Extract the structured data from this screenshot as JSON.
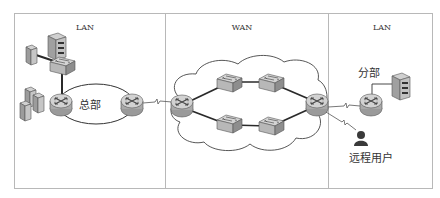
{
  "diagram": {
    "type": "network-topology",
    "colors": {
      "frame": "#b8b8b8",
      "link": "#3a3a3a",
      "cloud_stroke": "#444444",
      "device_fill": "#c9c9c9",
      "device_dark": "#7a7a7a",
      "user": "#333333"
    },
    "panels": [
      {
        "id": "lan-left",
        "label": "LAN"
      },
      {
        "id": "wan",
        "label": "WAN"
      },
      {
        "id": "lan-right",
        "label": "LAN"
      }
    ],
    "labels": {
      "headquarters": "总部",
      "branch": "分部",
      "remote_user": "远程用户"
    },
    "nodes": [
      {
        "id": "hq-server",
        "kind": "server"
      },
      {
        "id": "hq-pc",
        "kind": "pc"
      },
      {
        "id": "hq-switch",
        "kind": "switch"
      },
      {
        "id": "hq-pc-cluster",
        "kind": "pc-group"
      },
      {
        "id": "hq-router-inner",
        "kind": "router"
      },
      {
        "id": "hq-router-edge",
        "kind": "router"
      },
      {
        "id": "wan-router-left",
        "kind": "router"
      },
      {
        "id": "wan-switch-1",
        "kind": "switch"
      },
      {
        "id": "wan-switch-2",
        "kind": "switch"
      },
      {
        "id": "wan-switch-3",
        "kind": "switch"
      },
      {
        "id": "wan-switch-4",
        "kind": "switch"
      },
      {
        "id": "wan-router-right",
        "kind": "router"
      },
      {
        "id": "branch-router",
        "kind": "router"
      },
      {
        "id": "branch-server",
        "kind": "server"
      },
      {
        "id": "remote-user",
        "kind": "user"
      }
    ],
    "links": [
      {
        "from": "hq-pc",
        "to": "hq-switch",
        "style": "solid"
      },
      {
        "from": "hq-switch",
        "to": "hq-router-inner",
        "style": "solid"
      },
      {
        "from": "hq-router-inner",
        "to": "hq-router-edge",
        "style": "ellipse-ring"
      },
      {
        "from": "hq-router-edge",
        "to": "wan-router-left",
        "style": "serial"
      },
      {
        "from": "wan-router-left",
        "to": "wan-switch-1",
        "style": "solid"
      },
      {
        "from": "wan-switch-1",
        "to": "wan-switch-2",
        "style": "solid"
      },
      {
        "from": "wan-switch-2",
        "to": "wan-router-right",
        "style": "solid"
      },
      {
        "from": "wan-router-left",
        "to": "wan-switch-3",
        "style": "solid"
      },
      {
        "from": "wan-switch-3",
        "to": "wan-switch-4",
        "style": "solid"
      },
      {
        "from": "wan-switch-4",
        "to": "wan-router-right",
        "style": "solid"
      },
      {
        "from": "wan-router-right",
        "to": "branch-router",
        "style": "serial"
      },
      {
        "from": "wan-router-right",
        "to": "remote-user",
        "style": "serial"
      },
      {
        "from": "branch-router",
        "to": "branch-server",
        "style": "solid"
      }
    ]
  }
}
